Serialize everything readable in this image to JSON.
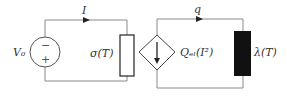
{
  "diagram": {
    "type": "equivalent circuit",
    "left_circuit": {
      "source_label": "V₀",
      "source_minus": "−",
      "source_plus": "+",
      "current_label": "I",
      "resistor_label": "σ(T)"
    },
    "right_circuit": {
      "heat_flow_label": "q",
      "dependent_source_label": "Qₑₗ(I²)",
      "conductor_label": "λ(T)"
    },
    "colors": {
      "wire": "#8a8a8a",
      "outline": "#333333",
      "fill_dark": "#111111",
      "background": "#ffffff"
    }
  }
}
